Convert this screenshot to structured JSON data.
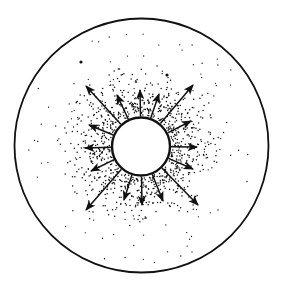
{
  "diagram": {
    "canvas": {
      "width": 281,
      "height": 282
    },
    "colors": {
      "ink": "#111111",
      "background": "#ffffff",
      "fill_inner": "#ffffff"
    },
    "outer_circle": {
      "cx": 141.5,
      "cy": 145.5,
      "r": 127,
      "stroke_width": 1.8
    },
    "inner_circle": {
      "cx": 141,
      "cy": 146.5,
      "r": 29,
      "stroke_width": 2.4
    },
    "arrows": [
      {
        "name": "arrow-up",
        "tip": [
          140,
          90
        ]
      },
      {
        "name": "arrow-up-right-short",
        "tip": [
          159,
          94
        ]
      },
      {
        "name": "arrow-up-right-long",
        "tip": [
          193,
          85
        ]
      },
      {
        "name": "arrow-right-upper",
        "tip": [
          191,
          121
        ]
      },
      {
        "name": "arrow-right",
        "tip": [
          197,
          147
        ]
      },
      {
        "name": "arrow-right-lower",
        "tip": [
          193,
          169
        ]
      },
      {
        "name": "arrow-down-right-long",
        "tip": [
          198,
          205
        ]
      },
      {
        "name": "arrow-down-right-short",
        "tip": [
          163,
          201
        ]
      },
      {
        "name": "arrow-down",
        "tip": [
          142,
          205
        ]
      },
      {
        "name": "arrow-down-left-short",
        "tip": [
          124,
          200
        ]
      },
      {
        "name": "arrow-down-left-long",
        "tip": [
          86,
          210
        ]
      },
      {
        "name": "arrow-left-lower",
        "tip": [
          91,
          171
        ]
      },
      {
        "name": "arrow-left",
        "tip": [
          85,
          148
        ]
      },
      {
        "name": "arrow-left-upper",
        "tip": [
          89,
          125
        ]
      },
      {
        "name": "arrow-up-left-long",
        "tip": [
          86,
          86
        ]
      },
      {
        "name": "arrow-up-left-short",
        "tip": [
          117,
          95
        ]
      }
    ],
    "stipple": {
      "seed": 7,
      "inner_dense_count": 900,
      "inner_dense_max_r": 72,
      "outer_sparse_count": 110,
      "outer_sparse_max_r": 118,
      "dot_radius": 0.75,
      "large_dots": [
        [
          81,
          62
        ],
        [
          167,
          75
        ]
      ]
    },
    "labels": []
  }
}
